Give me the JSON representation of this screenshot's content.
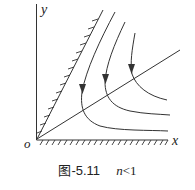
{
  "axes": {
    "y_label": "y",
    "x_label": "x",
    "origin_label": "o"
  },
  "caption": {
    "figure_id": "图-5.11",
    "condition_var": "n",
    "condition_op": "<",
    "condition_val": "1"
  },
  "elements": {
    "hatched_boundary_diagonal": "boundary line from origin, hatched on left side",
    "hatched_boundary_x_axis": "x-axis boundary, hatched below",
    "ray": "straight line through origin",
    "trajectories": [
      {
        "id": 1,
        "direction": "down then right",
        "arrow": "down"
      },
      {
        "id": 2,
        "direction": "down then right",
        "arrow": "down"
      },
      {
        "id": 3,
        "direction": "down then right",
        "arrow": "down"
      }
    ]
  },
  "colors": {
    "stroke": "#333333",
    "background": "#ffffff"
  }
}
